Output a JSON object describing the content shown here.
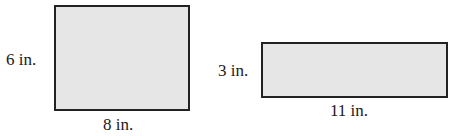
{
  "figures": [
    {
      "name": "rectangle-a",
      "width_label": "8 in.",
      "height_label": "6 in.",
      "width": 8,
      "height": 6,
      "unit": "in.",
      "fill": "#e6e6e6",
      "stroke": "#222222"
    },
    {
      "name": "rectangle-b",
      "width_label": "11 in.",
      "height_label": "3 in.",
      "width": 11,
      "height": 3,
      "unit": "in.",
      "fill": "#e6e6e6",
      "stroke": "#222222"
    }
  ]
}
